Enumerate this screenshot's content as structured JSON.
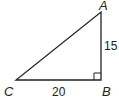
{
  "diagram": {
    "type": "right-triangle",
    "vertices": {
      "A": {
        "label": "A",
        "x": 101,
        "y": 12
      },
      "B": {
        "label": "B",
        "x": 101,
        "y": 80
      },
      "C": {
        "label": "C",
        "x": 16,
        "y": 80
      }
    },
    "sides": {
      "AB": {
        "label": "15"
      },
      "CB": {
        "label": "20"
      }
    },
    "right_angle_at": "B",
    "stroke_color": "#222222"
  }
}
